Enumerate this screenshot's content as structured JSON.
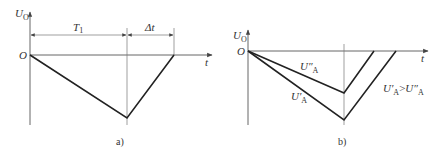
{
  "panels": [
    {
      "id": "a",
      "caption": "a)",
      "y_axis_label": "U",
      "y_axis_label_sub": "O",
      "x_axis_label": "t",
      "origin_label": "O",
      "dimensions": [
        {
          "label": "T",
          "sub": "1"
        },
        {
          "label": "Δt",
          "sub": ""
        }
      ],
      "curve": {
        "points": [
          [
            30,
            55
          ],
          [
            127,
            118
          ],
          [
            174,
            55
          ]
        ]
      }
    },
    {
      "id": "b",
      "caption": "b)",
      "y_axis_label": "U",
      "y_axis_label_sub": "O",
      "x_axis_label": "t",
      "origin_label": "O",
      "curves": [
        {
          "label": "U″",
          "sub": "A",
          "points": [
            [
              248,
              51
            ],
            [
              344,
              93
            ],
            [
              374,
              51
            ]
          ]
        },
        {
          "label": "U′",
          "sub": "A",
          "points": [
            [
              248,
              51
            ],
            [
              344,
              120
            ],
            [
              396,
              51
            ]
          ]
        }
      ],
      "annotation": {
        "left": "U′",
        "left_sub": "A",
        "op": ">",
        "right": "U″",
        "right_sub": "A"
      }
    }
  ]
}
